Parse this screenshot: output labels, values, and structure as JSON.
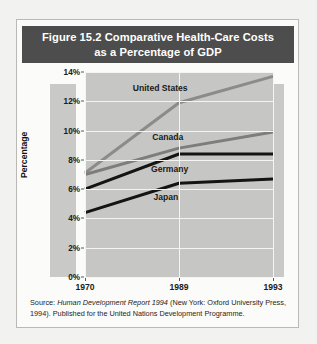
{
  "figure": {
    "title_line1": "Figure 15.2  Comparative Health-Care Costs",
    "title_line2": "as a Percentage of GDP",
    "source_prefix": "Source: ",
    "source_italic": "Human Development Report 1994",
    "source_rest": " (New York: Oxford University Press, 1994). Published for the United Nations Development Programme."
  },
  "colors": {
    "title_bar_bg": "#4d4d4d",
    "title_text": "#ffffff",
    "page_bg": "#f2f2f0",
    "plot_bg": "#c6c6c4",
    "band_bg": "#c9c9c7",
    "gridline": "#f4f4f2",
    "united_states_line": "#8b8b89",
    "canada_line": "#7d7d7b",
    "germany_line": "#141414",
    "japan_line": "#141414"
  },
  "chart_data": {
    "type": "line",
    "title": "Figure 15.2  Comparative Health-Care Costs as a Percentage of GDP",
    "xlabel": "",
    "ylabel": "Percentage",
    "x": [
      1970,
      1989,
      1993
    ],
    "xtick_labels": [
      "1970",
      "1989",
      "1993"
    ],
    "ytick_labels": [
      "0%",
      "2%",
      "4%",
      "6%",
      "8%",
      "10%",
      "12%",
      "14%"
    ],
    "ytick_values": [
      0,
      2,
      4,
      6,
      8,
      10,
      12,
      14
    ],
    "ylim": [
      0,
      14
    ],
    "grid": true,
    "legend_position": "inline-labels",
    "series": [
      {
        "name": "United States",
        "values": [
          7.1,
          11.9,
          13.7
        ],
        "color": "#8b8b89"
      },
      {
        "name": "Canada",
        "values": [
          7.0,
          8.8,
          9.9
        ],
        "color": "#7d7d7b"
      },
      {
        "name": "Germany",
        "values": [
          6.0,
          8.4,
          8.4
        ],
        "color": "#141414"
      },
      {
        "name": "Japan",
        "values": [
          4.4,
          6.4,
          6.7
        ],
        "color": "#141414"
      }
    ],
    "series_label_positions": [
      {
        "name": "United States",
        "x_frac": 0.4,
        "y_pct": 12.9
      },
      {
        "name": "Canada",
        "x_frac": 0.44,
        "y_pct": 9.55
      },
      {
        "name": "Germany",
        "x_frac": 0.45,
        "y_pct": 7.35
      },
      {
        "name": "Japan",
        "x_frac": 0.43,
        "y_pct": 5.45
      }
    ]
  }
}
